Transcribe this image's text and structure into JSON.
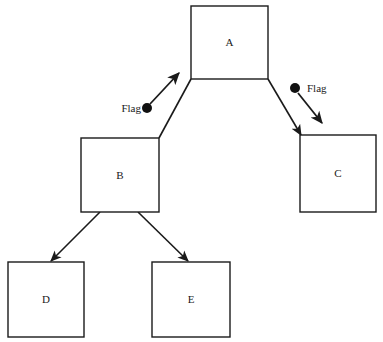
{
  "diagram": {
    "type": "tree-diagram",
    "canvas": {
      "width": 383,
      "height": 342
    },
    "colors": {
      "background": "#ffffff",
      "stroke": "#1a1a1a",
      "node_fill": "#ffffff",
      "flag_dot": "#111111"
    },
    "nodes": [
      {
        "id": "A",
        "label": "A",
        "x": 191,
        "y": 6,
        "width": 77,
        "height": 73
      },
      {
        "id": "B",
        "label": "B",
        "x": 81,
        "y": 138,
        "width": 78,
        "height": 74
      },
      {
        "id": "C",
        "label": "C",
        "x": 300,
        "y": 135,
        "width": 76,
        "height": 77
      },
      {
        "id": "D",
        "label": "D",
        "x": 8,
        "y": 262,
        "width": 76,
        "height": 75
      },
      {
        "id": "E",
        "label": "E",
        "x": 152,
        "y": 262,
        "width": 78,
        "height": 75
      }
    ],
    "edges": [
      {
        "id": "a-b",
        "from": "A",
        "to": "B",
        "arrow": false,
        "x1": 191,
        "y1": 79,
        "x2": 159,
        "y2": 138
      },
      {
        "id": "a-c",
        "from": "A",
        "to": "C",
        "arrow": true,
        "x1": 268,
        "y1": 79,
        "x2": 301,
        "y2": 135
      },
      {
        "id": "b-d",
        "from": "B",
        "to": "D",
        "arrow": true,
        "x1": 100,
        "y1": 212,
        "x2": 51,
        "y2": 261
      },
      {
        "id": "b-e",
        "from": "B",
        "to": "E",
        "arrow": true,
        "x1": 138,
        "y1": 212,
        "x2": 188,
        "y2": 261
      }
    ],
    "flags": [
      {
        "id": "flag-left",
        "label": "Flag",
        "label_side": "left",
        "label_x": 141,
        "label_y": 109,
        "dot_x": 147,
        "dot_y": 108,
        "dot_r": 5,
        "arrow_x1": 150,
        "arrow_y1": 104,
        "arrow_x2": 179,
        "arrow_y2": 73,
        "points_at": "a-b"
      },
      {
        "id": "flag-right",
        "label": "Flag",
        "label_side": "right",
        "label_x": 307,
        "label_y": 89,
        "dot_x": 295,
        "dot_y": 88,
        "dot_r": 5,
        "arrow_x1": 298,
        "arrow_y1": 93,
        "arrow_x2": 322,
        "arrow_y2": 123,
        "points_at": "a-c"
      }
    ]
  }
}
